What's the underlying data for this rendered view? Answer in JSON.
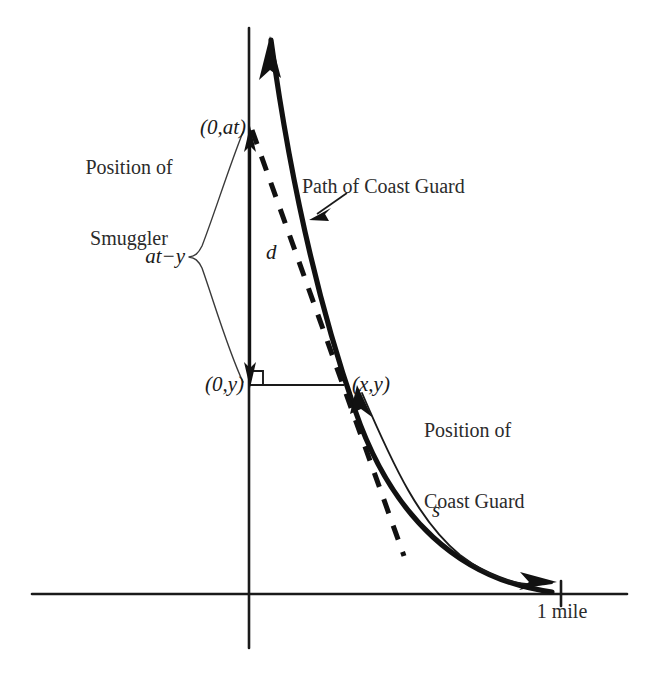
{
  "figure": {
    "type": "math-diagram",
    "background_color": "#ffffff",
    "ink_color": "#1a1a1a"
  },
  "axes": {
    "origin_label": "",
    "x_axis_name": "x-axis",
    "y_axis_name": "y-axis",
    "x_tick_label": "1 mile"
  },
  "labels": {
    "smuggler_line1": "Position of",
    "smuggler_line2": "Smuggler",
    "point_at": "(0,at)",
    "point_y": "(0,y)",
    "point_xy": "(x,y)",
    "segment_aty": "at−y",
    "segment_d": "d",
    "arc_s": "s",
    "path_callout": "Path of Coast Guard",
    "coastguard_line1": "Position of",
    "coastguard_line2": "Coast Guard",
    "mile_tick": "1 mile"
  },
  "geometry": {
    "x_axis": {
      "x1": 32,
      "y1": 594,
      "x2": 627,
      "y2": 594
    },
    "y_axis": {
      "x1": 249,
      "y1": 28,
      "x2": 249,
      "y2": 648
    },
    "tick_1mile": {
      "x": 561,
      "y_top": 584,
      "y_bottom": 604
    },
    "point_at": {
      "x": 249,
      "y": 128
    },
    "point_y": {
      "x": 249,
      "y": 385
    },
    "point_xy": {
      "x": 342,
      "y": 385
    },
    "curve_end": {
      "x": 555,
      "y": 592
    },
    "right_angle_size": 14
  }
}
